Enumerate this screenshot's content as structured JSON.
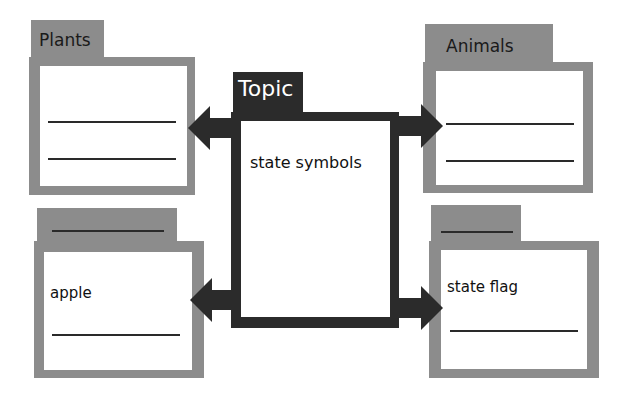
{
  "diagram": {
    "type": "concept web / graphic organizer",
    "center": {
      "tab_label": "Topic",
      "text": "state symbols"
    },
    "boxes": [
      {
        "id": "top-left",
        "tab_label": "Plants",
        "content": "",
        "blank_lines": 2
      },
      {
        "id": "top-right",
        "tab_label": "Animals",
        "content": "",
        "blank_lines": 2
      },
      {
        "id": "bottom-left",
        "tab_label": "",
        "content": "apple",
        "blank_lines": 1
      },
      {
        "id": "bottom-right",
        "tab_label": "",
        "content": "state flag",
        "blank_lines": 1
      }
    ],
    "colors": {
      "frame_gray": "#8c8c8c",
      "center_dark": "#2b2b2b",
      "arrow": "#2b2b2b",
      "background": "#ffffff"
    }
  }
}
